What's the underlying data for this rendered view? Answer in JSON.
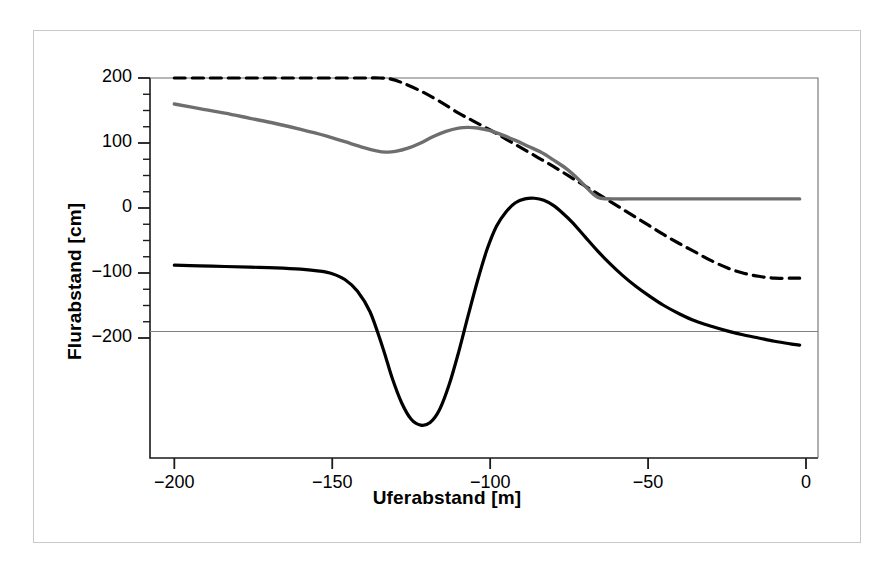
{
  "figure": {
    "background_color": "#ffffff",
    "frame_color": "#c9c9c9"
  },
  "chart_data": {
    "type": "line",
    "title": "",
    "subtitle": "",
    "xlabel": "Uferabstand [m]",
    "ylabel": "Flurabstand [cm]",
    "xlim": [
      -205,
      -2
    ],
    "ylim": [
      -380,
      215
    ],
    "xticks": [
      -200,
      -150,
      -100,
      -50,
      0
    ],
    "xtick_labels": [
      "−200",
      "−150",
      "−100",
      "−50",
      "0"
    ],
    "yticks": [
      200,
      100,
      0,
      -100,
      -200
    ],
    "ytick_labels": [
      "200",
      "100",
      "0",
      "−100",
      "−200"
    ],
    "minor_tick_step_y": 25,
    "grid": false,
    "legend": "none",
    "annotations": [
      {
        "name": "reference-line",
        "type": "hline",
        "y": -190,
        "color": "#808080",
        "linewidth": 1
      }
    ],
    "series": [
      {
        "name": "dashed-upper",
        "style": "dashed",
        "color": "#000000",
        "linewidth": 3.2,
        "x": [
          -200,
          -190,
          -180,
          -170,
          -160,
          -150,
          -140,
          -135,
          -132,
          -128,
          -122,
          -116,
          -110,
          -105,
          -100,
          -95,
          -90,
          -85,
          -80,
          -75,
          -70,
          -65,
          -60,
          -55,
          -50,
          -45,
          -40,
          -35,
          -30,
          -25,
          -20,
          -15,
          -10,
          -5,
          -2
        ],
        "y": [
          200,
          200,
          200,
          200,
          200,
          200,
          200,
          200,
          199,
          193,
          180,
          164,
          146,
          133,
          120,
          106,
          92,
          78,
          64,
          49,
          34,
          19,
          4,
          -11,
          -26,
          -41,
          -55,
          -68,
          -81,
          -92,
          -100,
          -105,
          -108,
          -108,
          -108
        ]
      },
      {
        "name": "gray-solid",
        "style": "solid",
        "color": "#6e6e6e",
        "linewidth": 3.4,
        "x": [
          -200,
          -192,
          -184,
          -176,
          -168,
          -160,
          -152,
          -146,
          -140,
          -136,
          -133,
          -130,
          -126,
          -122,
          -118,
          -114,
          -110,
          -107,
          -104,
          -100,
          -96,
          -92,
          -88,
          -84,
          -80,
          -76,
          -72,
          -69,
          -67,
          -65,
          -60,
          -55,
          -50,
          -40,
          -30,
          -20,
          -10,
          -2
        ],
        "y": [
          160,
          153,
          146,
          138,
          130,
          121,
          111,
          102,
          93,
          88,
          86,
          87,
          92,
          100,
          110,
          118,
          123,
          124,
          123,
          119,
          112,
          104,
          95,
          86,
          74,
          61,
          44,
          29,
          20,
          15,
          14,
          14,
          14,
          14,
          14,
          14,
          14,
          14
        ]
      },
      {
        "name": "black-solid",
        "style": "solid",
        "color": "#000000",
        "linewidth": 3.2,
        "x": [
          -200,
          -192,
          -184,
          -176,
          -168,
          -160,
          -154,
          -150,
          -146,
          -142,
          -138,
          -134,
          -131,
          -128,
          -125,
          -122,
          -119,
          -116,
          -113,
          -110,
          -107,
          -104,
          -101,
          -98,
          -95,
          -92,
          -89,
          -86,
          -83,
          -80,
          -77,
          -74,
          -70,
          -66,
          -62,
          -58,
          -54,
          -50,
          -45,
          -40,
          -35,
          -30,
          -25,
          -20,
          -15,
          -10,
          -5,
          -2
        ],
        "y": [
          -88,
          -89,
          -90,
          -91,
          -92,
          -94,
          -97,
          -101,
          -110,
          -128,
          -160,
          -215,
          -262,
          -300,
          -325,
          -334,
          -330,
          -310,
          -272,
          -222,
          -166,
          -112,
          -64,
          -28,
          -6,
          8,
          14,
          15,
          12,
          4,
          -8,
          -22,
          -44,
          -66,
          -86,
          -104,
          -120,
          -134,
          -150,
          -163,
          -174,
          -182,
          -189,
          -195,
          -200,
          -205,
          -209,
          -211
        ]
      }
    ]
  },
  "ticks": {
    "y": [
      {
        "label": "200",
        "value": 200
      },
      {
        "label": "100",
        "value": 100
      },
      {
        "label": "0",
        "value": 0
      },
      {
        "label": "−100",
        "value": -100
      },
      {
        "label": "−200",
        "value": -200
      }
    ],
    "x": [
      {
        "label": "−200",
        "value": -200
      },
      {
        "label": "−150",
        "value": -150
      },
      {
        "label": "−100",
        "value": -100
      },
      {
        "label": "−50",
        "value": -50
      },
      {
        "label": "0",
        "value": 0
      }
    ]
  },
  "labels": {
    "y_axis_title": "Flurabstand [cm]",
    "x_axis_title": "Uferabstand [m]"
  }
}
